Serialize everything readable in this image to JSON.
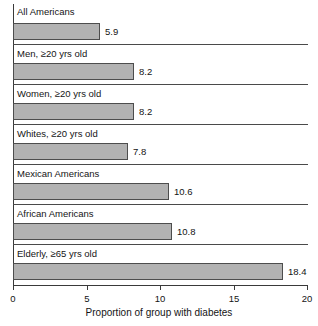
{
  "chart_data": {
    "type": "bar",
    "orientation": "horizontal",
    "title": "",
    "xlabel": "Proportion of group with diabetes",
    "ylabel": "",
    "xlim": [
      0,
      20
    ],
    "xticks": [
      0,
      5,
      10,
      15,
      20
    ],
    "xtick_labels": [
      "0",
      "5",
      "10",
      "15",
      "20"
    ],
    "grid": false,
    "legend": null,
    "bar_color": "#b2b2b2",
    "bar_edge_color": "#4d4d4d",
    "axis_color": "#3a3a3a",
    "categories": [
      "All Americans",
      "Men, ≥20 yrs old",
      "Women, ≥20 yrs old",
      "Whites, ≥20 yrs old",
      "Mexican Americans",
      "African Americans",
      "Elderly, ≥65 yrs old"
    ],
    "values": [
      5.9,
      8.2,
      8.2,
      7.8,
      10.6,
      10.8,
      18.4
    ],
    "value_labels": [
      "5.9",
      "8.2",
      "8.2",
      "7.8",
      "10.6",
      "10.8",
      "18.4"
    ]
  }
}
